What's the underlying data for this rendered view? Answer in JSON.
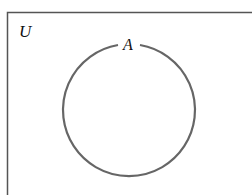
{
  "diagram": {
    "type": "venn",
    "universal_set_label": "U",
    "sets": [
      {
        "label": "A"
      }
    ],
    "colors": {
      "border": "#555555",
      "circle": "#666666",
      "text": "#111111",
      "background": "#ffffff"
    }
  }
}
